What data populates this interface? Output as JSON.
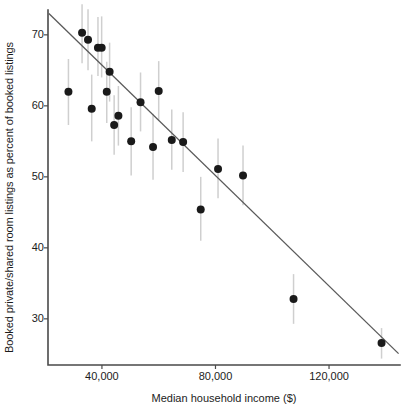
{
  "chart_data": {
    "type": "scatter",
    "title": "",
    "subtitle": "",
    "xlabel": "Median household income ($)",
    "ylabel": "Booked private/shared room listings as percent of booked listings",
    "xticks": [
      40000,
      80000,
      120000
    ],
    "xtick_labels": [
      "40,000",
      "80,000",
      "120,000"
    ],
    "yticks": [
      30,
      40,
      50,
      60,
      70
    ],
    "ytick_labels": [
      "30",
      "40",
      "50",
      "60",
      "70"
    ],
    "xlim": [
      21000,
      145000
    ],
    "ylim": [
      23.5,
      73.5
    ],
    "grid": false,
    "legend": null,
    "point_color": "#1a1a1a",
    "errorbar_color": "#cfcfcf",
    "fitline_color": "#595959",
    "axis_color": "#4a4a4a",
    "background_color": "#ffffff",
    "marker": "filled-circle",
    "marker_size_px": 8,
    "points": [
      {
        "x": 28200,
        "y": 62.0,
        "ylow": 57.3,
        "yhigh": 66.6
      },
      {
        "x": 33000,
        "y": 70.3,
        "ylow": 66.0,
        "yhigh": 74.3
      },
      {
        "x": 35100,
        "y": 69.3,
        "ylow": 65.0,
        "yhigh": 73.6
      },
      {
        "x": 36400,
        "y": 59.6,
        "ylow": 55.0,
        "yhigh": 64.4
      },
      {
        "x": 38600,
        "y": 68.2,
        "ylow": 64.2,
        "yhigh": 72.5
      },
      {
        "x": 39900,
        "y": 68.2,
        "ylow": 64.0,
        "yhigh": 72.6
      },
      {
        "x": 41700,
        "y": 62.0,
        "ylow": 57.6,
        "yhigh": 66.2
      },
      {
        "x": 42700,
        "y": 64.8,
        "ylow": 60.6,
        "yhigh": 68.9
      },
      {
        "x": 44300,
        "y": 57.3,
        "ylow": 53.1,
        "yhigh": 61.5
      },
      {
        "x": 45800,
        "y": 58.6,
        "ylow": 54.4,
        "yhigh": 62.8
      },
      {
        "x": 50300,
        "y": 55.0,
        "ylow": 50.2,
        "yhigh": 59.8
      },
      {
        "x": 53600,
        "y": 60.5,
        "ylow": 56.4,
        "yhigh": 64.7
      },
      {
        "x": 58000,
        "y": 54.2,
        "ylow": 49.6,
        "yhigh": 58.9
      },
      {
        "x": 60000,
        "y": 62.1,
        "ylow": 57.9,
        "yhigh": 66.3
      },
      {
        "x": 64600,
        "y": 55.2,
        "ylow": 51.0,
        "yhigh": 59.5
      },
      {
        "x": 68600,
        "y": 54.9,
        "ylow": 50.7,
        "yhigh": 59.1
      },
      {
        "x": 74800,
        "y": 45.4,
        "ylow": 41.0,
        "yhigh": 50.0
      },
      {
        "x": 80900,
        "y": 51.1,
        "ylow": 47.0,
        "yhigh": 55.4
      },
      {
        "x": 89700,
        "y": 50.2,
        "ylow": 46.0,
        "yhigh": 54.4
      },
      {
        "x": 107500,
        "y": 32.8,
        "ylow": 29.3,
        "yhigh": 36.3
      },
      {
        "x": 138500,
        "y": 26.6,
        "ylow": 24.4,
        "yhigh": 28.7
      }
    ],
    "fit_line": {
      "x_start": 21300,
      "y_start": 73.0,
      "x_end": 144500,
      "y_end": 25.1
    }
  }
}
